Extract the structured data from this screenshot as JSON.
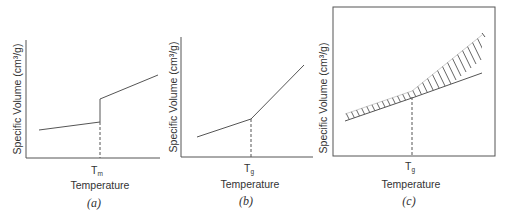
{
  "figure": {
    "panels": [
      {
        "id": "a",
        "caption": "(a)",
        "ylabel": "Specific Volume (cm³/g)",
        "xlabel": "Temperature",
        "tick_main": "T",
        "tick_sub": "m",
        "description": "Crystalline material: discontinuous jump in specific volume at melting temperature"
      },
      {
        "id": "b",
        "caption": "(b)",
        "ylabel": "Specific Volume (cm³/g)",
        "xlabel": "Temperature",
        "tick_main": "T",
        "tick_sub": "g",
        "description": "Amorphous material: change in slope at glass transition temperature"
      },
      {
        "id": "c",
        "caption": "(c)",
        "ylabel": "Specific Volume (cm³/g)",
        "xlabel": "Temperature",
        "tick_main": "T",
        "tick_sub": "g",
        "description": "Hatched band showing range of specific volume with slope change at glass transition"
      }
    ],
    "colors": {
      "line": "#555555",
      "text": "#333333",
      "background": "#ffffff"
    }
  }
}
